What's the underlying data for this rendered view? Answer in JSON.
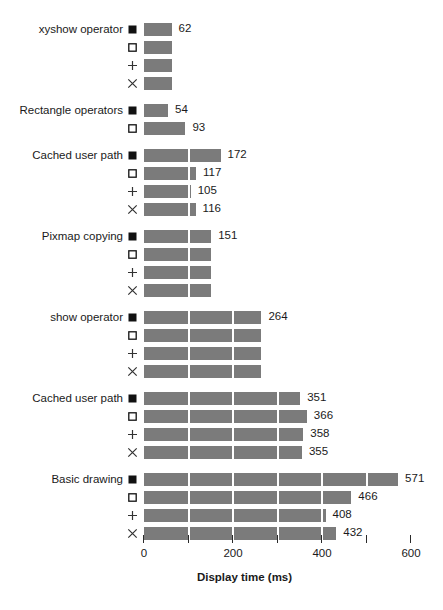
{
  "chart_data": {
    "type": "bar",
    "orientation": "horizontal",
    "title": "",
    "xlabel": "Display time (ms)",
    "ylabel": "",
    "xlim": [
      0,
      620
    ],
    "grid": true,
    "legend_position": "none",
    "axis": {
      "ticks": [
        0,
        100,
        200,
        300,
        400,
        500,
        600
      ],
      "tick_labels": [
        "0",
        "",
        "200",
        "",
        "400",
        "",
        "600"
      ]
    },
    "series": [
      {
        "name": "filled-square",
        "marker": "filled-square"
      },
      {
        "name": "open-square",
        "marker": "open-square"
      },
      {
        "name": "plus",
        "marker": "plus"
      },
      {
        "name": "cross",
        "marker": "cross"
      }
    ],
    "groups": [
      {
        "label": "xyshow operator",
        "bars": [
          {
            "marker": "filled-square",
            "value": 62,
            "label": "62"
          },
          {
            "marker": "open-square",
            "value": 62,
            "label": ""
          },
          {
            "marker": "plus",
            "value": 62,
            "label": ""
          },
          {
            "marker": "cross",
            "value": 62,
            "label": ""
          }
        ]
      },
      {
        "label": "Rectangle operators",
        "bars": [
          {
            "marker": "filled-square",
            "value": 54,
            "label": "54"
          },
          {
            "marker": "open-square",
            "value": 93,
            "label": "93"
          }
        ]
      },
      {
        "label": "Cached user path",
        "bars": [
          {
            "marker": "filled-square",
            "value": 172,
            "label": "172"
          },
          {
            "marker": "open-square",
            "value": 117,
            "label": "117"
          },
          {
            "marker": "plus",
            "value": 105,
            "label": "105"
          },
          {
            "marker": "cross",
            "value": 116,
            "label": "116"
          }
        ]
      },
      {
        "label": "Pixmap copying",
        "bars": [
          {
            "marker": "filled-square",
            "value": 151,
            "label": "151"
          },
          {
            "marker": "open-square",
            "value": 151,
            "label": ""
          },
          {
            "marker": "plus",
            "value": 151,
            "label": ""
          },
          {
            "marker": "cross",
            "value": 151,
            "label": ""
          }
        ]
      },
      {
        "label": "show operator",
        "bars": [
          {
            "marker": "filled-square",
            "value": 264,
            "label": "264"
          },
          {
            "marker": "open-square",
            "value": 264,
            "label": ""
          },
          {
            "marker": "plus",
            "value": 264,
            "label": ""
          },
          {
            "marker": "cross",
            "value": 264,
            "label": ""
          }
        ]
      },
      {
        "label": "Cached user path",
        "bars": [
          {
            "marker": "filled-square",
            "value": 351,
            "label": "351"
          },
          {
            "marker": "open-square",
            "value": 366,
            "label": "366"
          },
          {
            "marker": "plus",
            "value": 358,
            "label": "358"
          },
          {
            "marker": "cross",
            "value": 355,
            "label": "355"
          }
        ]
      },
      {
        "label": "Basic drawing",
        "bars": [
          {
            "marker": "filled-square",
            "value": 571,
            "label": "571"
          },
          {
            "marker": "open-square",
            "value": 466,
            "label": "466"
          },
          {
            "marker": "plus",
            "value": 408,
            "label": "408"
          },
          {
            "marker": "cross",
            "value": 432,
            "label": "432"
          }
        ]
      }
    ],
    "colors": {
      "bar": "#7b7b7b",
      "background": "#ffffff",
      "text": "#1a1a1a",
      "gridline": "#ffffff"
    }
  }
}
